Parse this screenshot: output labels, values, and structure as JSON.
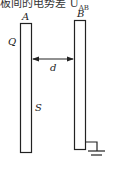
{
  "caption": {
    "text": "板间的电势差 U",
    "subscript": "AB"
  },
  "diagram": {
    "plate_a": {
      "label": "A",
      "charge_label": "Q",
      "area_label": "S"
    },
    "plate_b": {
      "label": "B",
      "grounded": true
    },
    "separation_label": "d",
    "stroke_color": "#222222"
  }
}
